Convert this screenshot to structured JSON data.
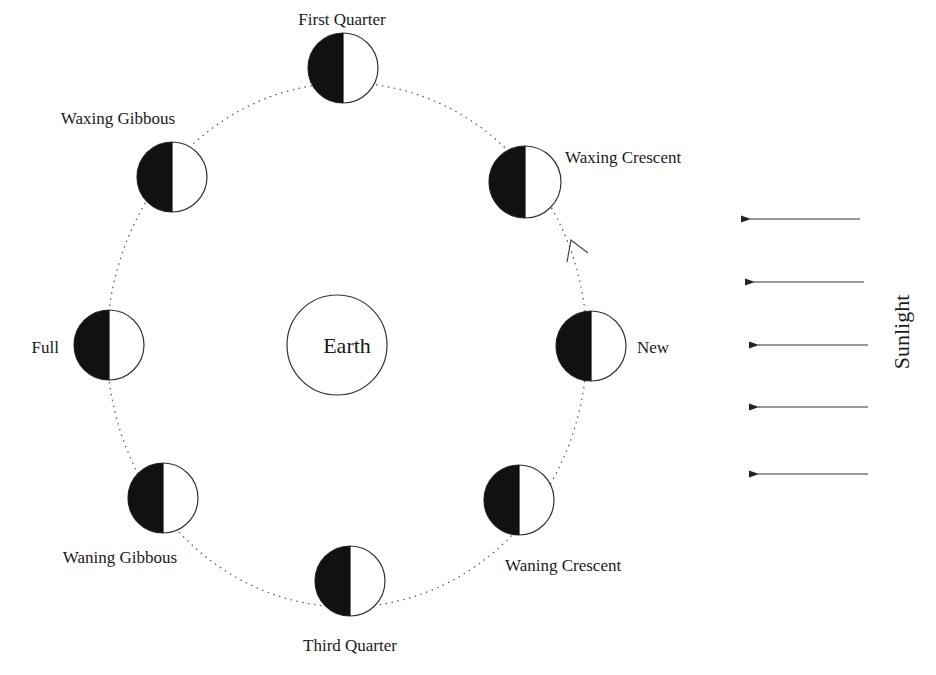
{
  "earth": {
    "label": "Earth",
    "cx": 337,
    "cy": 345,
    "r": 50
  },
  "orbit": {
    "cx": 347,
    "cy": 345,
    "rx": 240,
    "ry": 262
  },
  "colors": {
    "dark": "#111111",
    "light": "#ffffff",
    "stroke": "#333333",
    "text": "#1a1a1a"
  },
  "direction_arrow": {
    "tip": [
      571,
      240
    ],
    "arm1": [
      567,
      262
    ],
    "arm2": [
      588,
      253
    ]
  },
  "phases": [
    {
      "name": "First Quarter",
      "cx": 343,
      "cy": 68,
      "r": 35,
      "label_x": 342,
      "label_y": 25,
      "anchor": "middle"
    },
    {
      "name": "Waxing Crescent",
      "cx": 525,
      "cy": 182,
      "r": 36,
      "label_x": 565,
      "label_y": 163,
      "anchor": "start"
    },
    {
      "name": "New",
      "cx": 591,
      "cy": 346,
      "r": 35,
      "label_x": 637,
      "label_y": 353,
      "anchor": "start"
    },
    {
      "name": "Waning Crescent",
      "cx": 519,
      "cy": 500,
      "r": 35,
      "label_x": 505,
      "label_y": 571,
      "anchor": "start"
    },
    {
      "name": "Third Quarter",
      "cx": 350,
      "cy": 581,
      "r": 35,
      "label_x": 350,
      "label_y": 651,
      "anchor": "middle"
    },
    {
      "name": "Waning Gibbous",
      "cx": 163,
      "cy": 498,
      "r": 35,
      "label_x": 120,
      "label_y": 563,
      "anchor": "middle"
    },
    {
      "name": "Full",
      "cx": 109,
      "cy": 345,
      "r": 35,
      "label_x": 59,
      "label_y": 353,
      "anchor": "end"
    },
    {
      "name": "Waxing Gibbous",
      "cx": 172,
      "cy": 177,
      "r": 35,
      "label_x": 118,
      "label_y": 124,
      "anchor": "middle"
    }
  ],
  "sunlight": {
    "label": "Sunlight",
    "label_x": 904,
    "label_y": 332,
    "arrows": [
      {
        "x1": 860,
        "x2": 742,
        "y": 219
      },
      {
        "x1": 864,
        "x2": 746,
        "y": 282
      },
      {
        "x1": 868,
        "x2": 750,
        "y": 345
      },
      {
        "x1": 868,
        "x2": 750,
        "y": 407
      },
      {
        "x1": 868,
        "x2": 750,
        "y": 474
      }
    ]
  }
}
